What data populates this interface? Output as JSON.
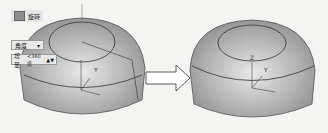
{
  "panel": {
    "title": "旋转",
    "title_icon": "rotate-icon",
    "mode_dropdown": {
      "selected": "角度",
      "arrow": "▾"
    },
    "increment": {
      "label": "增量",
      "value": "<360度",
      "spin": "▲▼"
    }
  },
  "scene": {
    "before_model": "dome-with-rotated-profile",
    "arrow": "right-arrow",
    "after_model": "rotated-dome",
    "axis_labels": [
      "Z",
      "Y",
      "X"
    ]
  }
}
